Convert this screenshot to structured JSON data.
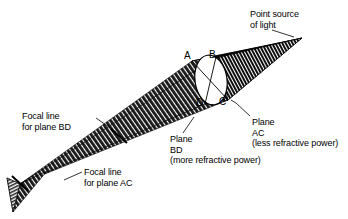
{
  "figure": {
    "background_color": "#ffffff",
    "ink_color": "#000000"
  },
  "annotations": {
    "point_source": "Point source\nof light",
    "plane_ac": "Plane\nAC\n(less refractive power)",
    "plane_bd": "Plane\nBD\n(more refractive power)",
    "focal_line_bd": "Focal line\nfor plane BD",
    "focal_line_ac": "Focal line\nfor plane AC"
  },
  "point_labels": {
    "a": "A",
    "b": "B",
    "c": "C",
    "d": "D"
  },
  "geometry": {
    "source_point": [
      302,
      38
    ],
    "lens_center": [
      211,
      80
    ],
    "lens_rx": 16,
    "lens_ry": 26,
    "point_a": [
      192,
      61
    ],
    "point_b": [
      216,
      57
    ],
    "point_c": [
      228,
      100
    ],
    "point_d": [
      205,
      104
    ],
    "focal_line_bd_point": [
      119,
      136
    ],
    "focal_line_ac_point": [
      20,
      184
    ],
    "cone_end_point": [
      13,
      212
    ]
  }
}
